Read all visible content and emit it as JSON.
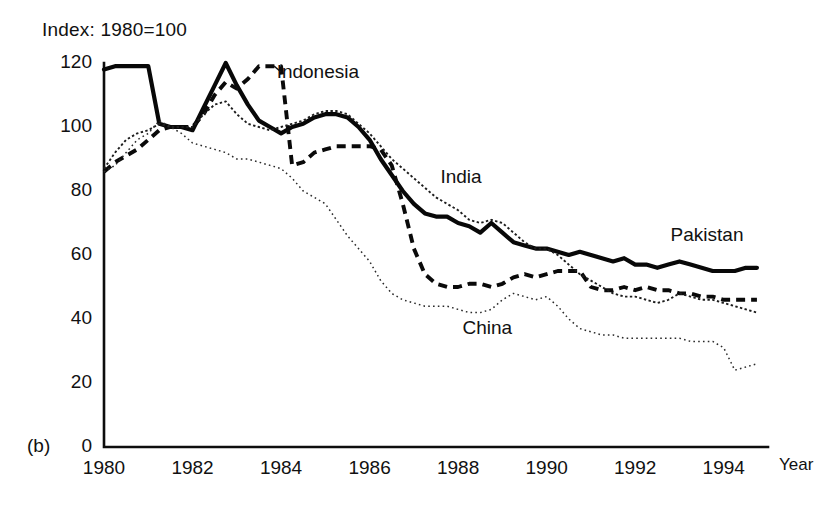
{
  "figure": {
    "panel_label": "(b)",
    "index_note": "Index: 1980=100",
    "year_axis_label": "Year"
  },
  "chart_data": {
    "type": "line",
    "title": "Index: 1980=100",
    "subtitle": "(b)",
    "xlabel": "Year",
    "ylabel": "",
    "xlim": [
      1980,
      1995
    ],
    "ylim": [
      0,
      120
    ],
    "grid": false,
    "legend_position": "inline-annotations",
    "yticks": [
      0,
      20,
      40,
      60,
      80,
      100,
      120
    ],
    "xticks": [
      1980,
      1982,
      1984,
      1986,
      1988,
      1990,
      1992,
      1994
    ],
    "ytick_labels": [
      "0",
      "20",
      "40",
      "60",
      "80",
      "100",
      "120"
    ],
    "xtick_labels": [
      "1980",
      "1982",
      "1984",
      "1986",
      "1988",
      "1990",
      "1992",
      "1994"
    ],
    "annotations": [
      {
        "text": "Indonesia",
        "x": 1983.9,
        "y": 117
      },
      {
        "text": "India",
        "x": 1987.6,
        "y": 84
      },
      {
        "text": "Pakistan",
        "x": 1992.8,
        "y": 66
      },
      {
        "text": "China",
        "x": 1988.1,
        "y": 37
      }
    ],
    "x": [
      1980.0,
      1980.25,
      1980.5,
      1980.75,
      1981.0,
      1981.25,
      1981.5,
      1981.75,
      1982.0,
      1982.25,
      1982.5,
      1982.75,
      1983.0,
      1983.25,
      1983.5,
      1983.75,
      1984.0,
      1984.25,
      1984.5,
      1984.75,
      1985.0,
      1985.25,
      1985.5,
      1985.75,
      1986.0,
      1986.25,
      1986.5,
      1986.75,
      1987.0,
      1987.25,
      1987.5,
      1987.75,
      1988.0,
      1988.25,
      1988.5,
      1988.75,
      1989.0,
      1989.25,
      1989.5,
      1989.75,
      1990.0,
      1990.25,
      1990.5,
      1990.75,
      1991.0,
      1991.25,
      1991.5,
      1991.75,
      1992.0,
      1992.25,
      1992.5,
      1992.75,
      1993.0,
      1993.25,
      1993.5,
      1993.75,
      1994.0,
      1994.25,
      1994.5,
      1994.75
    ],
    "series": [
      {
        "name": "Pakistan",
        "style": "thick-solid",
        "values": [
          118,
          119,
          119,
          119,
          119,
          101,
          100,
          100,
          99,
          106,
          113,
          120,
          113,
          107,
          102,
          100,
          98,
          100,
          101,
          103,
          104,
          104,
          103,
          100,
          96,
          90,
          85,
          80,
          76,
          73,
          72,
          72,
          70,
          69,
          67,
          70,
          67,
          64,
          63,
          62,
          62,
          61,
          60,
          61,
          60,
          59,
          58,
          59,
          57,
          57,
          56,
          57,
          58,
          57,
          56,
          55,
          55,
          55,
          56,
          56
        ]
      },
      {
        "name": "Indonesia",
        "style": "thick-dashed",
        "values": [
          86,
          89,
          91,
          93,
          96,
          99,
          100,
          100,
          100,
          104,
          110,
          114,
          112,
          115,
          119,
          119,
          119,
          88,
          89,
          92,
          93,
          94,
          94,
          94,
          94,
          93,
          88,
          76,
          62,
          54,
          51,
          50,
          50,
          51,
          51,
          50,
          51,
          53,
          54,
          53,
          54,
          55,
          55,
          55,
          50,
          49,
          49,
          50,
          49,
          50,
          49,
          49,
          48,
          48,
          47,
          47,
          46,
          46,
          46,
          46
        ]
      },
      {
        "name": "India",
        "style": "fine-dotted",
        "values": [
          87,
          92,
          96,
          98,
          99,
          101,
          100,
          100,
          100,
          104,
          107,
          108,
          104,
          101,
          100,
          99,
          100,
          101,
          102,
          104,
          105,
          105,
          104,
          101,
          98,
          94,
          90,
          87,
          84,
          81,
          78,
          76,
          74,
          71,
          70,
          71,
          70,
          67,
          64,
          62,
          62,
          60,
          57,
          54,
          52,
          50,
          48,
          47,
          47,
          46,
          45,
          46,
          48,
          47,
          46,
          46,
          45,
          44,
          43,
          42
        ]
      },
      {
        "name": "China",
        "style": "fine-dash-dot",
        "values": [
          86,
          88,
          92,
          96,
          98,
          102,
          100,
          98,
          95,
          94,
          93,
          92,
          90,
          90,
          89,
          88,
          87,
          84,
          80,
          78,
          76,
          71,
          66,
          62,
          58,
          52,
          48,
          46,
          45,
          44,
          44,
          44,
          43,
          42,
          42,
          43,
          46,
          48,
          47,
          46,
          47,
          44,
          40,
          37,
          36,
          35,
          35,
          34,
          34,
          34,
          34,
          34,
          34,
          33,
          33,
          33,
          31,
          24,
          25,
          26
        ]
      }
    ]
  }
}
